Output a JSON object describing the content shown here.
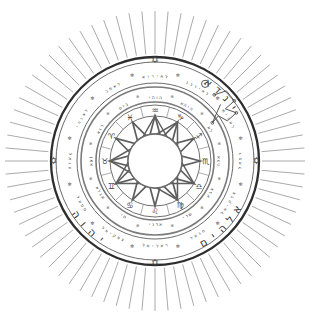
{
  "artwork": {
    "title": "Magic Circle Talisman",
    "kind": "esoteric-seal-diagram",
    "background_color": "#ffffff",
    "ink_color": "#5e5e5e",
    "accent_ink_color": "#2e2e2e",
    "canvas": {
      "width": 311,
      "height": 322
    },
    "center": {
      "x": 155,
      "y": 161
    }
  },
  "sunburst": {
    "name": "radiating-rays",
    "ray_count": 72,
    "inner_radius": 105,
    "outer_radius": 150,
    "color": "#8d8d8d"
  },
  "rings": [
    {
      "id": "outer-bold-circle",
      "radius": 104,
      "stroke": "#2e2e2e",
      "width": 2.3
    },
    {
      "id": "outer-band-outer",
      "radius": 99,
      "stroke": "#6a6a6a",
      "width": 1
    },
    {
      "id": "outer-band-inner",
      "radius": 78,
      "stroke": "#6a6a6a",
      "width": 1
    },
    {
      "id": "mid-band-outer",
      "radius": 74,
      "stroke": "#7a7a7a",
      "width": 1.6
    },
    {
      "id": "mid-band-inner",
      "radius": 59,
      "stroke": "#7a7a7a",
      "width": 1.6
    },
    {
      "id": "inner-band-outer",
      "radius": 56,
      "stroke": "#6f6f6f",
      "width": 1
    },
    {
      "id": "inner-band-inner",
      "radius": 45,
      "stroke": "#6f6f6f",
      "width": 1
    },
    {
      "id": "core-circle",
      "radius": 27,
      "stroke": "#6a6a6a",
      "width": 1.4
    }
  ],
  "divine_names": {
    "label": "Divine names in outer band",
    "items": [
      {
        "text": "יהוה",
        "transliteration": "YHVH",
        "position": "upper-left",
        "angle": -135
      },
      {
        "text": "אלהים",
        "transliteration": "Elohim",
        "position": "lower-left",
        "angle": 135
      },
      {
        "text": "אדני",
        "transliteration": "Adonai",
        "position": "lower-right",
        "angle": 45
      }
    ]
  },
  "sigil": {
    "name": "spirit-sigil",
    "position": "upper-right",
    "description": "angular line seal with nodes"
  },
  "sun_symbol": {
    "name": "sun-icon",
    "position": "top-right-of-outer-band",
    "glyph": "☉"
  },
  "cardinal_markers": {
    "name": "hexagram-markers",
    "glyph": "✡",
    "count": 4,
    "positions": [
      "top",
      "right",
      "bottom",
      "left"
    ]
  },
  "angel_names": {
    "label": "Angelic names in outer band",
    "items": [
      "אוריאל",
      "גבריאל",
      "מיכאל",
      "רפאל",
      "צדקיאל",
      "חנאל",
      "ראליאל",
      "צפקיאל",
      "סמאל",
      "ענאל",
      "יהואל",
      "כמאל"
    ]
  },
  "inner_names": {
    "label": "Hebrew names around twelve-pointed star",
    "items": [
      "יהוה",
      "אהיה",
      "אל",
      "אלה",
      "צבא",
      "שדי",
      "אדני",
      "חי",
      "אגלא",
      "אמן",
      "אור",
      "טוב"
    ]
  },
  "zodiac": {
    "label": "Zodiac signs in inner band",
    "signs": [
      {
        "name": "Aquarius",
        "glyph": "♒",
        "angle": -75
      },
      {
        "name": "Capricorn",
        "glyph": "♑",
        "angle": -45
      },
      {
        "name": "Sagittarius",
        "glyph": "♐",
        "angle": -15
      },
      {
        "name": "Scorpio",
        "glyph": "♏",
        "angle": 15
      },
      {
        "name": "Libra",
        "glyph": "♎",
        "angle": 45
      },
      {
        "name": "Virgo",
        "glyph": "♍",
        "angle": 75
      },
      {
        "name": "Leo",
        "glyph": "♌",
        "angle": 105
      },
      {
        "name": "Cancer",
        "glyph": "♋",
        "angle": 135
      },
      {
        "name": "Gemini",
        "glyph": "♊",
        "angle": 165
      },
      {
        "name": "Taurus",
        "glyph": "♉",
        "angle": 195
      },
      {
        "name": "Aries",
        "glyph": "♈",
        "angle": 225
      },
      {
        "name": "Pisces",
        "glyph": "♓",
        "angle": 255
      }
    ]
  },
  "star": {
    "name": "twelve-pointed-star",
    "points": 12,
    "outer_radius": 45,
    "inner_radius": 27,
    "skip": 5,
    "stroke": "#5e5e5e"
  }
}
